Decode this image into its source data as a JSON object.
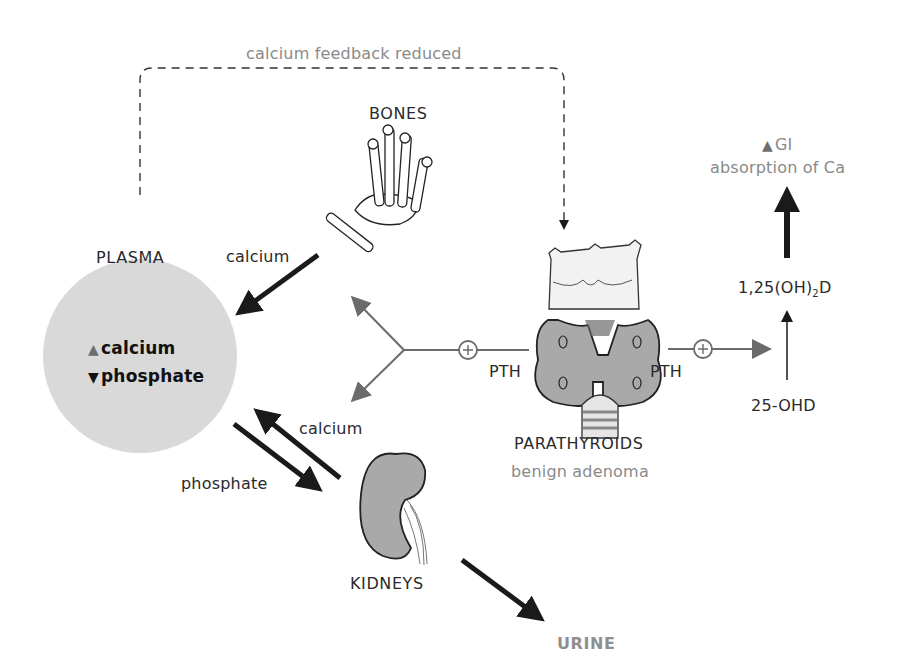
{
  "feedback": {
    "label": "calcium feedback reduced"
  },
  "plasma": {
    "title": "PLASMA",
    "items": [
      {
        "direction": "up",
        "symbol": "▲",
        "label": "calcium"
      },
      {
        "direction": "down",
        "symbol": "▼",
        "label": "phosphate"
      }
    ],
    "fill": "#d9d9d9"
  },
  "bones": {
    "title": "BONES",
    "flow_label": "calcium"
  },
  "parathyroids": {
    "title": "PARATHYROIDS",
    "subtitle": "benign adenoma"
  },
  "pth": {
    "left_label": "PTH",
    "right_label": "PTH",
    "stimulate_symbol": "+"
  },
  "vitamin_d": {
    "active_prefix": "1,25(OH)",
    "active_sub": "2",
    "active_suffix": "D",
    "precursor": "25-OHD"
  },
  "gi": {
    "symbol": "▲",
    "line1": "GI",
    "line2": "absorption of Ca"
  },
  "kidneys": {
    "title": "KIDNEYS",
    "calcium_label": "calcium",
    "phosphate_label": "phosphate"
  },
  "urine": {
    "label": "URINE"
  },
  "colors": {
    "arrow_dark": "#1a1a1a",
    "arrow_gray": "#6b6b6b",
    "text_gray": "#8a8a8a",
    "organ_gray": "#a9a9a9"
  }
}
